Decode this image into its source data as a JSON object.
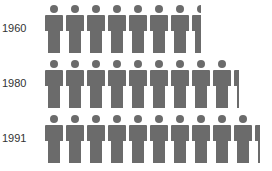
{
  "chart_data": {
    "type": "pictograph",
    "title": "",
    "categories": [
      "1960",
      "1980",
      "1991"
    ],
    "values": [
      7.5,
      9.3,
      10.3
    ],
    "unit_icon": "person-icon",
    "icon_color": "#6b6b6b"
  },
  "rows": [
    {
      "label": "1960",
      "value": 7.5
    },
    {
      "label": "1980",
      "value": 9.3
    },
    {
      "label": "1991",
      "value": 10.3
    }
  ]
}
